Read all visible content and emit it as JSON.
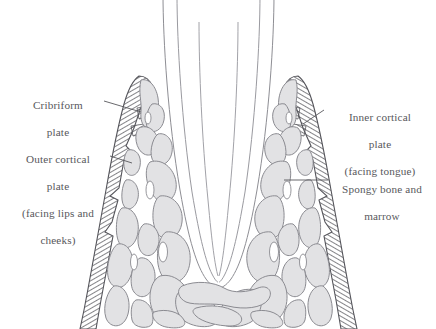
{
  "figure": {
    "background_color": "#ffffff",
    "line_color": "#6f6f74",
    "hatch_color": "#5a5a60",
    "spongy_fill": "#e2e2e4",
    "spongy_stroke": "#8a8a90",
    "text_color": "#58585c"
  },
  "labels": {
    "cribriform": {
      "line1": "Cribriform",
      "line2": "plate"
    },
    "outer_cortical": {
      "line1": "Outer cortical",
      "line2": "plate",
      "line3": "(facing lips and",
      "line4": "cheeks)"
    },
    "inner_cortical": {
      "line1": "Inner cortical",
      "line2": "plate",
      "line3": "(facing tongue)"
    },
    "spongy": {
      "line1": "Spongy bone and",
      "line2": "marrow"
    }
  },
  "caption": {
    "text": ""
  }
}
